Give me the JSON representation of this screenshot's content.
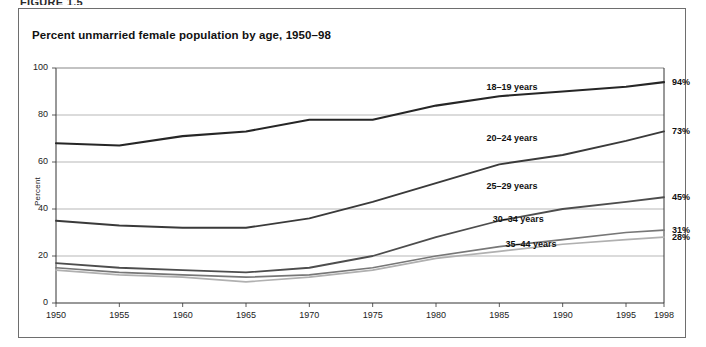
{
  "running_header": "FIGURE 1.5",
  "figure": {
    "title": "Percent unmarried female population by age, 1950–98"
  },
  "chart_data": {
    "type": "line",
    "title": "Percent unmarried female population by age, 1950–98",
    "xlabel": "",
    "ylabel": "Percent",
    "xlim": [
      1950,
      1998
    ],
    "ylim": [
      0,
      100
    ],
    "grid": true,
    "grid_axis": "y",
    "legend": "inline-series-labels",
    "x": [
      1950,
      1955,
      1960,
      1965,
      1970,
      1975,
      1980,
      1985,
      1990,
      1995,
      1998
    ],
    "xtick_labels": [
      "1950",
      "1955",
      "1960",
      "1965",
      "1970",
      "1975",
      "1980",
      "1985",
      "1990",
      "1995",
      "1998"
    ],
    "ytick_labels": [
      "0",
      "20",
      "40",
      "60",
      "80",
      "100"
    ],
    "ytick_values": [
      0,
      20,
      40,
      60,
      80,
      100
    ],
    "series": [
      {
        "name": "18–19 years",
        "label": "18–19 years",
        "end_label": "94%",
        "end_value": 94,
        "color": "#262626",
        "width": 2.1,
        "values": [
          68,
          67,
          71,
          73,
          78,
          78,
          84,
          88,
          90,
          92,
          94
        ]
      },
      {
        "name": "20–24 years",
        "label": "20–24 years",
        "end_label": "73%",
        "end_value": 73,
        "color": "#3a3a3a",
        "width": 1.9,
        "values": [
          35,
          33,
          32,
          32,
          36,
          43,
          51,
          59,
          63,
          69,
          73
        ]
      },
      {
        "name": "25–29 years",
        "label": "25–29 years",
        "end_label": "45%",
        "end_value": 45,
        "color": "#4d4d4d",
        "width": 1.8,
        "values": [
          17,
          15,
          14,
          13,
          15,
          20,
          28,
          35,
          40,
          43,
          45
        ]
      },
      {
        "name": "30–34 years",
        "label": "30–34 years",
        "end_label": "31%",
        "end_value": 31,
        "color": "#777777",
        "width": 1.7,
        "values": [
          15,
          13,
          12,
          11,
          12,
          15,
          20,
          24,
          27,
          30,
          31
        ]
      },
      {
        "name": "35–44 years",
        "label": "35–44 years",
        "end_label": "28%",
        "end_value": 28,
        "color": "#b0b0b0",
        "width": 1.7,
        "values": [
          14,
          12,
          11,
          9,
          11,
          14,
          19,
          22,
          25,
          27,
          28
        ]
      }
    ],
    "series_label_positions": [
      {
        "name": "18–19 years",
        "x": 1986.0,
        "y": 91.5
      },
      {
        "name": "20–24 years",
        "x": 1986.0,
        "y": 70.0
      },
      {
        "name": "25–29 years",
        "x": 1986.0,
        "y": 49.5
      },
      {
        "name": "30–34 years",
        "x": 1986.5,
        "y": 35.5
      },
      {
        "name": "35–44 years",
        "x": 1987.5,
        "y": 24.5
      }
    ],
    "colors": {
      "grid": "#9a9a9a",
      "axis": "#333333",
      "frame": "#6e6e6e",
      "background": "#ffffff"
    }
  }
}
